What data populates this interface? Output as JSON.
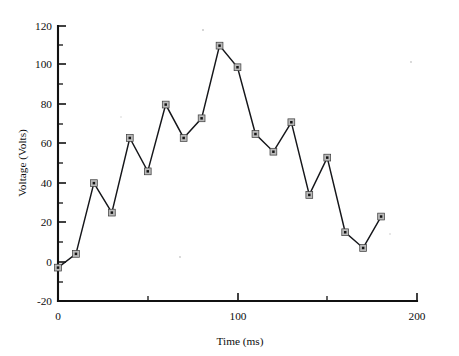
{
  "chart_data": {
    "type": "line",
    "title": "",
    "xlabel": "Time (ms)",
    "ylabel": "Voltage (Volts)",
    "xlim": [
      0,
      200
    ],
    "ylim": [
      -20,
      120
    ],
    "grid": false,
    "legend": false,
    "x": [
      0,
      10,
      20,
      30,
      40,
      50,
      60,
      70,
      80,
      90,
      100,
      110,
      120,
      130,
      140,
      150,
      160,
      170,
      180
    ],
    "values": [
      -3,
      4,
      40,
      25,
      63,
      46,
      80,
      63,
      73,
      110,
      99,
      65,
      56,
      71,
      34,
      53,
      15,
      7,
      23
    ],
    "series": [
      {
        "name": "Voltage",
        "values": [
          -3,
          4,
          40,
          25,
          63,
          46,
          80,
          63,
          73,
          110,
          99,
          65,
          56,
          71,
          34,
          53,
          15,
          7,
          23
        ]
      }
    ],
    "x_ticks_major": [
      0,
      100,
      200
    ],
    "x_tick_labels": [
      "0",
      "100",
      "200"
    ],
    "x_ticks_minor": [
      50,
      150
    ],
    "y_ticks_major": [
      -20,
      0,
      20,
      40,
      60,
      80,
      100,
      120
    ],
    "y_tick_labels": [
      "-20",
      "0",
      "20",
      "40",
      "60",
      "80",
      "100",
      "120"
    ],
    "y_ticks_minor": [
      -10,
      10,
      30,
      50,
      70,
      90,
      110
    ],
    "marker": "square",
    "line_color": "#15161a",
    "marker_fill": "#b9b9b9",
    "marker_core": "#141414"
  },
  "axes": {
    "y_title": "Voltage (Volts)",
    "x_title": "Time (ms)"
  }
}
